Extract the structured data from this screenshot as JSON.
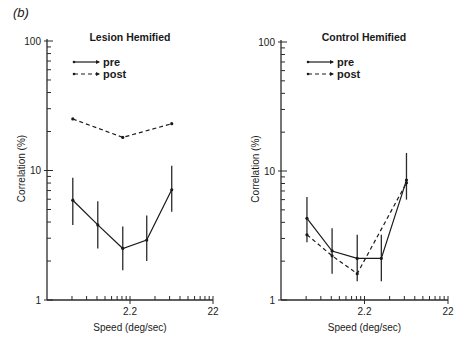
{
  "figure_label": "(b)",
  "chart_data": [
    {
      "type": "line",
      "title": "Lesion Hemified",
      "xlabel": "Speed (deg/sec)",
      "ylabel": "Correlation (%)",
      "xscale": "log",
      "yscale": "log",
      "xlim": [
        0.22,
        22
      ],
      "ylim": [
        1,
        100
      ],
      "xticks_labeled": [
        {
          "value": 2.2,
          "label": "2.2"
        },
        {
          "value": 22,
          "label": "22"
        }
      ],
      "yticks_labeled": [
        {
          "value": 1,
          "label": "1"
        },
        {
          "value": 10,
          "label": "10"
        },
        {
          "value": 100,
          "label": "100"
        }
      ],
      "grid": false,
      "legend": {
        "position": "top-left",
        "entries": [
          "pre",
          "post"
        ]
      },
      "series": [
        {
          "name": "pre",
          "style": "solid",
          "x": [
            0.45,
            0.9,
            1.8,
            3.5,
            7.0
          ],
          "y": [
            5.9,
            3.8,
            2.5,
            2.9,
            7.1
          ],
          "err_high": [
            8.8,
            5.8,
            3.7,
            4.5,
            10.9
          ],
          "err_low": [
            3.8,
            2.5,
            1.7,
            2.0,
            4.8
          ]
        },
        {
          "name": "post",
          "style": "dashed",
          "x": [
            0.45,
            1.8,
            7.0
          ],
          "y": [
            25,
            18,
            23
          ]
        }
      ]
    },
    {
      "type": "line",
      "title": "Control Hemified",
      "xlabel": "Speed (deg/sec)",
      "ylabel": "Correlation (%)",
      "xscale": "log",
      "yscale": "log",
      "xlim": [
        0.22,
        22
      ],
      "ylim": [
        1,
        100
      ],
      "xticks_labeled": [
        {
          "value": 2.2,
          "label": "2.2"
        },
        {
          "value": 22,
          "label": "22"
        }
      ],
      "yticks_labeled": [
        {
          "value": 1,
          "label": "1"
        },
        {
          "value": 10,
          "label": "10"
        },
        {
          "value": 100,
          "label": "100"
        }
      ],
      "grid": false,
      "legend": {
        "position": "top-left",
        "entries": [
          "pre",
          "post"
        ]
      },
      "series": [
        {
          "name": "pre",
          "style": "solid",
          "x": [
            0.45,
            0.9,
            1.8,
            3.5,
            7.0
          ],
          "y": [
            4.3,
            2.4,
            2.1,
            2.1,
            8.5
          ],
          "err_high": [
            6.3,
            3.6,
            3.2,
            3.2,
            13.8
          ],
          "err_low": [
            2.8,
            1.6,
            1.4,
            1.4,
            6.0
          ]
        },
        {
          "name": "post",
          "style": "dashed",
          "x": [
            0.45,
            0.9,
            1.8,
            7.0
          ],
          "y": [
            3.2,
            2.2,
            1.6,
            8.1
          ]
        }
      ]
    }
  ]
}
